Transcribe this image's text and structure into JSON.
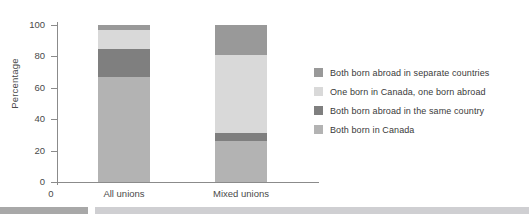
{
  "chart_data": {
    "type": "bar",
    "stacked": true,
    "title": "",
    "subtitle": "",
    "xlabel": "",
    "ylabel": "Percentage",
    "ylim": [
      0,
      100
    ],
    "yticks": [
      0,
      20,
      40,
      60,
      80,
      100
    ],
    "ytick_labels": [
      "0",
      "20",
      "40",
      "60",
      "80",
      "100"
    ],
    "grid": false,
    "legend_position": "right",
    "categories": [
      "All unions",
      "Mixed unions"
    ],
    "series": [
      {
        "name": "Both born in Canada",
        "color": "#b3b3b3",
        "values": [
          67,
          26
        ]
      },
      {
        "name": "Both born abroad in the same country",
        "color": "#7f7f7f",
        "values": [
          18,
          5
        ]
      },
      {
        "name": "One born in Canada, one born abroad",
        "color": "#d9d9d9",
        "values": [
          12,
          50
        ]
      },
      {
        "name": "Both born abroad in separate countries",
        "color": "#999999",
        "values": [
          3,
          19
        ]
      }
    ],
    "legend_entries": [
      {
        "label": "Both born abroad in separate countries",
        "color": "#999999"
      },
      {
        "label": "One born in Canada, one born abroad",
        "color": "#d9d9d9"
      },
      {
        "label": "Both born abroad in the same country",
        "color": "#7f7f7f"
      },
      {
        "label": "Both born in Canada",
        "color": "#b3b3b3"
      }
    ],
    "annotations": {
      "origin_label": "0"
    }
  },
  "decor": {
    "footer_bar_left_color": "#a8a8a8",
    "footer_bar_right_color": "#cfcfd2"
  }
}
